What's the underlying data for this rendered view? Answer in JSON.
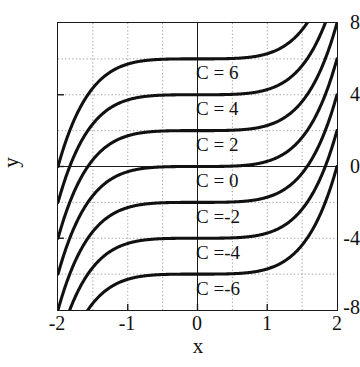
{
  "chart_data": {
    "type": "line",
    "title": "",
    "xlabel": "x",
    "ylabel": "y",
    "xlim": [
      -2,
      2
    ],
    "ylim": [
      -8,
      8
    ],
    "grid": true,
    "grid_style": "dotted",
    "legend_position": "inline-annotations",
    "xticks": [
      -2,
      -1,
      0,
      1,
      2
    ],
    "xtick_labels": [
      "-2",
      "-1",
      "0",
      "1",
      "2"
    ],
    "yticks": [
      -8,
      -4,
      0,
      4,
      8
    ],
    "ytick_labels": [
      "-8",
      "-4",
      "0",
      "4",
      "8"
    ],
    "x_gridlines": [
      -1.5,
      -1,
      -0.5,
      0,
      0.5,
      1,
      1.5
    ],
    "y_gridlines": [
      -6,
      -4,
      -2,
      0,
      2,
      4,
      6
    ],
    "x": [
      -2,
      -1.75,
      -1.5,
      -1.25,
      -1,
      -0.75,
      -0.5,
      -0.25,
      0,
      0.25,
      0.5,
      0.75,
      1,
      1.25,
      1.5,
      1.75,
      2
    ],
    "series": [
      {
        "name": "C = 6",
        "C": 6,
        "label": "C = 6",
        "color": "#111111",
        "values": [
          0,
          2.1,
          3.8,
          4.95,
          5.55,
          5.85,
          5.96,
          5.995,
          6,
          6.005,
          6.04,
          6.15,
          6.45,
          7.05,
          8.2,
          9.9,
          12
        ]
      },
      {
        "name": "C = 4",
        "C": 4,
        "label": "C = 4",
        "color": "#111111",
        "values": [
          -2,
          0.1,
          1.8,
          2.95,
          3.55,
          3.85,
          3.96,
          3.995,
          4,
          4.005,
          4.04,
          4.15,
          4.45,
          5.05,
          6.2,
          7.9,
          10
        ]
      },
      {
        "name": "C = 2",
        "C": 2,
        "label": "C = 2",
        "color": "#111111",
        "values": [
          -4,
          -1.9,
          -0.2,
          0.95,
          1.55,
          1.85,
          1.96,
          1.995,
          2,
          2.005,
          2.04,
          2.15,
          2.45,
          3.05,
          4.2,
          5.9,
          8
        ]
      },
      {
        "name": "C = 0",
        "C": 0,
        "label": "C = 0",
        "color": "#111111",
        "values": [
          -6,
          -3.9,
          -2.2,
          -1.05,
          -0.45,
          -0.15,
          -0.04,
          -0.005,
          0,
          0.005,
          0.04,
          0.15,
          0.45,
          1.05,
          2.2,
          3.9,
          6
        ]
      },
      {
        "name": "C = -2",
        "C": -2,
        "label": "C =-2",
        "color": "#111111",
        "values": [
          -8,
          -5.9,
          -4.2,
          -3.05,
          -2.45,
          -2.15,
          -2.04,
          -2.005,
          -2,
          -1.995,
          -1.96,
          -1.85,
          -1.55,
          -0.95,
          0.2,
          1.9,
          4
        ]
      },
      {
        "name": "C = -4",
        "C": -4,
        "label": "C =-4",
        "color": "#111111",
        "values": [
          -10,
          -7.9,
          -6.2,
          -5.05,
          -4.45,
          -4.15,
          -4.04,
          -4.005,
          -4,
          -3.995,
          -3.96,
          -3.85,
          -3.55,
          -2.95,
          -1.8,
          -0.1,
          2
        ]
      },
      {
        "name": "C = -6",
        "C": -6,
        "label": "C =-6",
        "color": "#111111",
        "values": [
          -12,
          -9.9,
          -8.2,
          -7.05,
          -6.45,
          -6.15,
          -6.04,
          -6.005,
          -6,
          -5.995,
          -5.96,
          -5.85,
          -5.55,
          -4.95,
          -3.8,
          -2.1,
          0
        ]
      }
    ]
  },
  "style": {
    "axis_color": "#1a1a1a",
    "grid_color": "#9a9a9a",
    "curve_color": "#111111",
    "background": "#ffffff"
  }
}
